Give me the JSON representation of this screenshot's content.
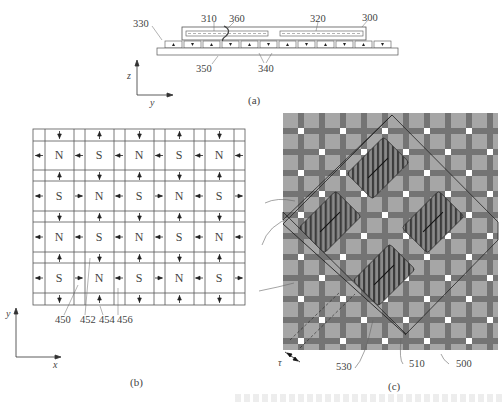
{
  "figure": {
    "panel_a": {
      "caption": "(a)",
      "labels": {
        "outer_box": "300",
        "coil_left": "310",
        "coil_right": "320",
        "frame": "330",
        "magnets": "340",
        "base": "350",
        "rotation": "360"
      },
      "axes": {
        "vertical": "z",
        "horizontal": "y"
      },
      "magnet_arrows": [
        "up",
        "down",
        "up",
        "down",
        "up",
        "down",
        "up",
        "down",
        "up",
        "down",
        "up",
        "down"
      ]
    },
    "panel_b": {
      "caption": "(b)",
      "grid_labels": [
        [
          "N",
          "S",
          "N",
          "S",
          "N"
        ],
        [
          "S",
          "N",
          "S",
          "N",
          "S"
        ],
        [
          "N",
          "S",
          "N",
          "S",
          "N"
        ],
        [
          "S",
          "N",
          "S",
          "N",
          "S"
        ]
      ],
      "callouts": {
        "a": "450",
        "b": "452",
        "c": "454",
        "d": "456"
      },
      "axes": {
        "vertical": "y",
        "horizontal": "x"
      }
    },
    "panel_c": {
      "caption": "(c)",
      "callouts": {
        "coil_array": "510",
        "base": "500",
        "boundary": "530"
      },
      "pitch_label": "τ",
      "colors": {
        "light_square": "#a8a8a8",
        "dark_strip": "#6e6e6e",
        "white_spot": "#ffffff",
        "coil": "#555555"
      }
    }
  }
}
